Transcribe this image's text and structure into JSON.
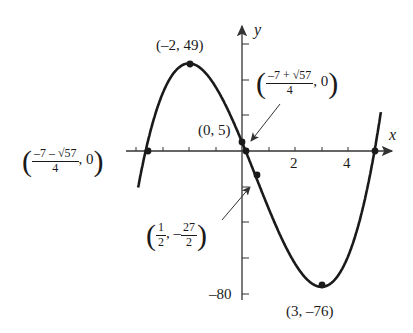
{
  "chart_data": {
    "type": "line",
    "title": "",
    "function": "f(x) = 2x^3 - 3x^2 - 36x + 5",
    "xlabel": "x",
    "ylabel": "y",
    "x_ticks_labeled": [
      2,
      4
    ],
    "y_ticks_labeled": [
      -80
    ],
    "x_tick_spacing": 1,
    "y_tick_spacing": 20,
    "xlim": [
      -4,
      5.8
    ],
    "ylim": [
      -80,
      60
    ],
    "grid": false,
    "series": [
      {
        "name": "f(x)",
        "x": [
          -3.9,
          -3.637,
          -3,
          -2,
          -1,
          0,
          0.137,
          0.5,
          1,
          2,
          3,
          4,
          5,
          5.2
        ],
        "values": [
          -19.3,
          0,
          32,
          49,
          36,
          5,
          0,
          -13.5,
          -32,
          -63,
          -76,
          -63,
          0,
          16.3
        ]
      }
    ],
    "annotations": [
      {
        "id": "max",
        "point": [
          -2,
          49
        ],
        "label": "(–2, 49)"
      },
      {
        "id": "yint",
        "point": [
          0,
          5
        ],
        "label": "(0, 5)"
      },
      {
        "id": "root-right-small",
        "point": [
          0.137,
          0
        ],
        "label_num": "–7 + √57",
        "label_den": "4",
        "label_y": "0"
      },
      {
        "id": "root-left",
        "point": [
          -3.637,
          0
        ],
        "label_num": "–7 – √57",
        "label_den": "4",
        "label_y": "0"
      },
      {
        "id": "inflection",
        "point": [
          0.5,
          -13.5
        ],
        "label_x_num": "1",
        "label_x_den": "2",
        "label_y_num": "27",
        "label_y_den": "2",
        "label_y_sign": "–"
      },
      {
        "id": "min",
        "point": [
          3,
          -76
        ],
        "label": "(3, –76)"
      },
      {
        "id": "root-5",
        "point": [
          5,
          0
        ]
      }
    ]
  },
  "labels": {
    "x_axis": "x",
    "y_axis": "y",
    "tick_2": "2",
    "tick_4": "4",
    "tick_neg80": "–80",
    "max": "(–2, 49)",
    "yint": "(0, 5)",
    "min": "(3, –76)",
    "root_plus_num": "–7 + √57",
    "root_plus_den": "4",
    "root_minus_num": "–7 – √57",
    "root_minus_den": "4",
    "zero": "0",
    "comma": ",",
    "open": "(",
    "close": ")",
    "inf_x_num": "1",
    "inf_x_den": "2",
    "inf_y_sign": "–",
    "inf_y_num": "27",
    "inf_y_den": "2"
  },
  "colors": {
    "curve": "#1a1a1a",
    "axes": "#333333",
    "background": "#ffffff"
  }
}
